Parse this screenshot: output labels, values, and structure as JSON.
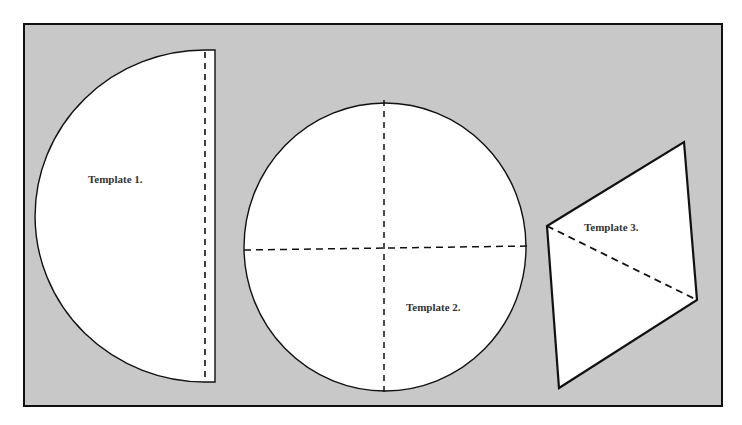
{
  "colors": {
    "background": "#ffffff",
    "panel": "#c8c8c8",
    "shape_fill": "#ffffff",
    "stroke": "#111111"
  },
  "templates": [
    {
      "id": 1,
      "label": "Template 1.",
      "shape": "semicircle",
      "fold_line": "dashed vertical near straight edge"
    },
    {
      "id": 2,
      "label": "Template 2.",
      "shape": "circle",
      "fold_line": "dashed cross (vertical and horizontal diameters)"
    },
    {
      "id": 3,
      "label": "Template 3.",
      "shape": "parallelogram",
      "fold_line": "dashed diagonal"
    }
  ]
}
